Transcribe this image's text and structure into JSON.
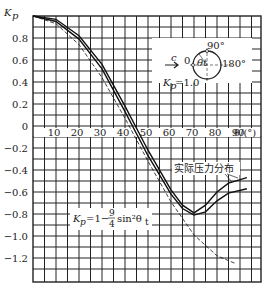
{
  "chart_data": {
    "type": "line",
    "title": "",
    "xlabel": "θ/(°)",
    "ylabel": "K_p",
    "xlim": [
      0,
      99
    ],
    "ylim": [
      -1.31,
      1.0
    ],
    "grid": true,
    "x_ticks": [
      10,
      20,
      30,
      40,
      50,
      60,
      70,
      80,
      90
    ],
    "y_ticks": [
      0.8,
      0.6,
      0.4,
      0.2,
      0,
      -0.2,
      -0.4,
      -0.6,
      -0.8,
      -1.0,
      -1.2
    ],
    "y_tick_labels": [
      "0.8",
      "0.6",
      "0.4",
      "0.2",
      "0",
      "-0.2",
      "-0.4",
      "-0.6",
      "-0.8",
      "-1.0",
      "-1.2"
    ],
    "series": [
      {
        "name": "theory",
        "label": "K_p = 1 − (9/4) sin²θ_t",
        "style": "dashed",
        "x": [
          0,
          10,
          20,
          30,
          40,
          50,
          60,
          70,
          80,
          88
        ],
        "y": [
          1.0,
          0.93,
          0.74,
          0.44,
          0.07,
          -0.32,
          -0.69,
          -0.99,
          -1.18,
          -1.25
        ]
      },
      {
        "name": "actual-upper",
        "label": "实际压力分布",
        "style": "solid",
        "x": [
          0,
          10,
          20,
          30,
          40,
          50,
          60,
          65,
          70,
          75,
          80,
          85,
          93
        ],
        "y": [
          1.0,
          0.97,
          0.82,
          0.56,
          0.18,
          -0.22,
          -0.58,
          -0.72,
          -0.79,
          -0.72,
          -0.6,
          -0.52,
          -0.47
        ]
      },
      {
        "name": "actual-lower",
        "label": "实际压力分布",
        "style": "solid",
        "x": [
          0,
          10,
          20,
          30,
          40,
          50,
          60,
          65,
          70,
          75,
          80,
          85,
          93
        ],
        "y": [
          1.0,
          0.95,
          0.79,
          0.52,
          0.13,
          -0.27,
          -0.62,
          -0.75,
          -0.81,
          -0.78,
          -0.68,
          -0.61,
          -0.57
        ]
      }
    ],
    "annotations": [
      {
        "text": "实际压力分布",
        "x": 83,
        "y": -0.42
      },
      {
        "text": "K_p=1−(9/4)sin²θ_t",
        "x": 30,
        "y": -0.93
      },
      {
        "text": "K_p=1.0",
        "x": 55,
        "y": 0.6
      }
    ],
    "inset": {
      "flow_label": "c",
      "angles": [
        "0",
        "90°",
        "180°"
      ],
      "angle_symbol": "θ_t",
      "label": "K_p=1.0"
    }
  },
  "labels": {
    "y_axis": "K",
    "y_axis_sub": "p",
    "x_axis": "θ/(°)",
    "actual": "实际压力分布",
    "formula_k": "K",
    "formula_sub": "p",
    "formula_rest": "=1−",
    "formula_num": "9",
    "formula_den": "4",
    "formula_sin": "sin²θ",
    "formula_t": "t",
    "inset_k": "K",
    "inset_sub": "p",
    "inset_rest": "=1.0",
    "inset_c": "c",
    "inset_0": "0",
    "inset_90": "90°",
    "inset_180": "180°",
    "inset_theta": "θt"
  }
}
